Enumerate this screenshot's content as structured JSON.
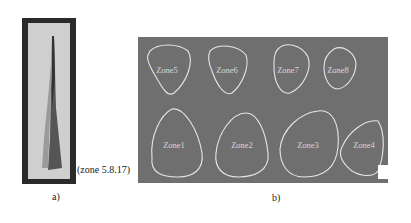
{
  "figure": {
    "panel_a": {
      "caption": "(zone 5.8.17)",
      "label": "a)"
    },
    "panel_b": {
      "label": "b)",
      "zones": [
        {
          "name": "Zone5",
          "cx": 29,
          "cy": 33
        },
        {
          "name": "Zone6",
          "cx": 89,
          "cy": 33
        },
        {
          "name": "Zone7",
          "cx": 150,
          "cy": 33
        },
        {
          "name": "Zone8",
          "cx": 200,
          "cy": 33
        },
        {
          "name": "Zone1",
          "cx": 34,
          "cy": 104
        },
        {
          "name": "Zone2",
          "cx": 97,
          "cy": 104
        },
        {
          "name": "Zone3",
          "cx": 163,
          "cy": 104
        },
        {
          "name": "Zone4",
          "cx": 223,
          "cy": 104
        }
      ]
    }
  }
}
